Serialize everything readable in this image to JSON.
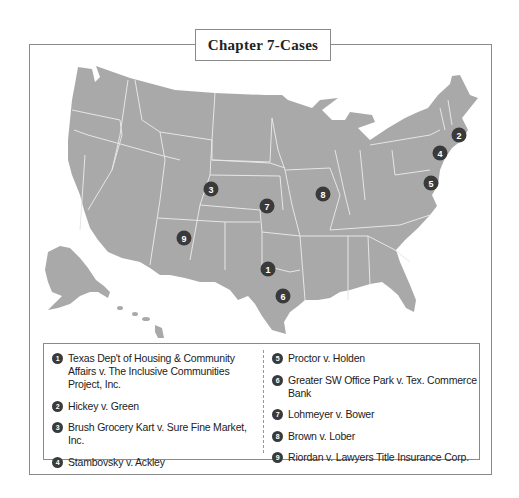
{
  "title": "Chapter 7-Cases",
  "map": {
    "fill_color": "#a9a9a9",
    "border_color": "#e8e8e8",
    "marker_color": "#3a3a3a",
    "markers": [
      {
        "n": "1",
        "x": 268,
        "y": 269
      },
      {
        "n": "2",
        "x": 459,
        "y": 135
      },
      {
        "n": "3",
        "x": 211,
        "y": 189
      },
      {
        "n": "4",
        "x": 440,
        "y": 153
      },
      {
        "n": "5",
        "x": 431,
        "y": 183
      },
      {
        "n": "6",
        "x": 283,
        "y": 296
      },
      {
        "n": "7",
        "x": 267,
        "y": 206
      },
      {
        "n": "8",
        "x": 323,
        "y": 194
      },
      {
        "n": "9",
        "x": 184,
        "y": 238
      }
    ]
  },
  "legend": {
    "left": [
      {
        "n": "1",
        "label": "Texas Dep't of Housing & Community Affairs v. The Inclusive Communities Project, Inc."
      },
      {
        "n": "2",
        "label": "Hickey v. Green"
      },
      {
        "n": "3",
        "label": "Brush Grocery Kart v. Sure Fine Market, Inc."
      },
      {
        "n": "4",
        "label": "Stambovsky v. Ackley"
      }
    ],
    "right": [
      {
        "n": "5",
        "label": "Proctor v. Holden"
      },
      {
        "n": "6",
        "label": "Greater SW Office Park v. Tex. Commerce Bank"
      },
      {
        "n": "7",
        "label": "Lohmeyer v. Bower"
      },
      {
        "n": "8",
        "label": "Brown v. Lober"
      },
      {
        "n": "9",
        "label": "Riordan v. Lawyers Title Insurance Corp."
      }
    ]
  }
}
